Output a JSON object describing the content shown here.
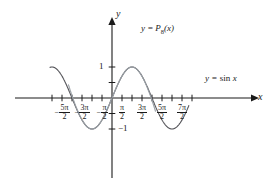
{
  "figure": {
    "title": "",
    "axis_labels": {
      "x": "x",
      "y": "y"
    },
    "curve_labels": {
      "polynomial": "y = P₈(x)",
      "polynomial_parts": {
        "lead": "y =",
        "fn": "P",
        "sub": "8",
        "arg": "(x)"
      },
      "sine": "y = sin x",
      "sine_parts": {
        "lead": "y =",
        "fn": "sin",
        "arg": "x"
      }
    },
    "y_ticks": [
      {
        "value": 1,
        "label": "1"
      },
      {
        "value": 0.5,
        "label": ""
      },
      {
        "value": -0.5,
        "label": ""
      },
      {
        "value": -1,
        "label": "−1",
        "minus": "−",
        "num": "1"
      }
    ],
    "x_ticks": [
      {
        "value": -3.0,
        "label": "",
        "num": "",
        "den": "",
        "sign": ""
      },
      {
        "value": -2.5,
        "label": "−5π/2",
        "sign": "−",
        "num": "5π",
        "den": "2"
      },
      {
        "value": -2.0,
        "label": "",
        "num": "",
        "den": "",
        "sign": ""
      },
      {
        "value": -1.5,
        "label": "−3π/2",
        "sign": "−",
        "num": "3π",
        "den": "2"
      },
      {
        "value": -1.0,
        "label": "",
        "num": "",
        "den": "",
        "sign": ""
      },
      {
        "value": -0.5,
        "label": "−π/2",
        "sign": "−",
        "num": "π",
        "den": "2"
      },
      {
        "value": 0.5,
        "label": "π/2",
        "sign": "",
        "num": "π",
        "den": "2"
      },
      {
        "value": 1.0,
        "label": "",
        "num": "",
        "den": "",
        "sign": ""
      },
      {
        "value": 1.5,
        "label": "3π/2",
        "sign": "",
        "num": "3π",
        "den": "2"
      },
      {
        "value": 2.0,
        "label": "",
        "num": "",
        "den": "",
        "sign": ""
      },
      {
        "value": 2.5,
        "label": "5π/2",
        "sign": "",
        "num": "5π",
        "den": "2"
      },
      {
        "value": 3.0,
        "label": "",
        "num": "",
        "den": "",
        "sign": ""
      },
      {
        "value": 3.5,
        "label": "7π/2",
        "sign": "",
        "num": "7π",
        "den": "2"
      },
      {
        "value": 4.0,
        "label": "",
        "num": "",
        "den": "",
        "sign": ""
      }
    ]
  },
  "chart_data": {
    "type": "line",
    "title": "",
    "xlabel": "x",
    "ylabel": "y",
    "xlim": [
      -3.3,
      4.1
    ],
    "ylim": [
      -1.55,
      1.55
    ],
    "x_unit": "pi/2",
    "grid": false,
    "legend": "inline-annotations",
    "series": [
      {
        "name": "y = sin x",
        "formula": "sin(x)",
        "color": "#55555a",
        "x_domain": [
          -3.12,
          3.85
        ],
        "x_domain_units": "multiples of pi/2",
        "key_points": [
          {
            "x": -2.5,
            "y": 1
          },
          {
            "x": -2.0,
            "y": 0
          },
          {
            "x": -1.5,
            "y": -1
          },
          {
            "x": -1.0,
            "y": 0
          },
          {
            "x": -0.5,
            "y": 1
          },
          {
            "x": 0.0,
            "y": 0
          },
          {
            "x": 0.5,
            "y": 1
          },
          {
            "x": 1.0,
            "y": 0
          },
          {
            "x": 1.5,
            "y": -1
          },
          {
            "x": 2.0,
            "y": 0
          },
          {
            "x": 2.5,
            "y": 1
          },
          {
            "x": 3.0,
            "y": 0
          },
          {
            "x": 3.5,
            "y": -1
          }
        ]
      },
      {
        "name": "y = P₈(x)",
        "formula": "x - x^3/6 + x^5/120 - x^7/5040",
        "degree": 8,
        "color": "#9aa0a6",
        "x_domain": [
          -2.18,
          2.18
        ],
        "x_domain_units": "multiples of pi/2",
        "note": "Maclaurin polynomial; overlaps sin x near origin, diverges beyond |x| ≈ 3.3"
      }
    ]
  },
  "geometry": {
    "origin_px": {
      "x": 112,
      "y": 98
    },
    "px_per_half_pi": 20,
    "px_per_unit_y": 31,
    "x_axis_span_px": {
      "start": 15,
      "end": 252
    },
    "y_axis_span_px": {
      "top": 24,
      "bottom": 178
    }
  }
}
